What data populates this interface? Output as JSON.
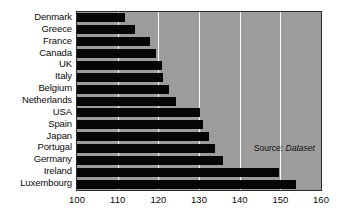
{
  "chart_data": {
    "type": "bar",
    "orientation": "horizontal",
    "title": "",
    "subtitle": "",
    "xlabel": "",
    "ylabel": "",
    "xlim": [
      100,
      160
    ],
    "ylim": null,
    "grid": true,
    "gridlines_x": [
      110,
      120,
      130,
      140,
      150
    ],
    "legend": null,
    "legend_position": "none",
    "xticks": [
      100,
      110,
      120,
      130,
      140,
      150,
      160
    ],
    "xtick_labels": [
      "100",
      "110",
      "120",
      "130",
      "140",
      "150",
      "160"
    ],
    "categories": [
      "Denmark",
      "Greece",
      "France",
      "Canada",
      "UK",
      "Italy",
      "Belgium",
      "Netherlands",
      "USA",
      "Spain",
      "Japan",
      "Portugal",
      "Germany",
      "Ireland",
      "Luxembourg"
    ],
    "values": [
      111.8,
      114.3,
      118.0,
      119.5,
      120.8,
      121.2,
      122.5,
      124.3,
      130.3,
      131.0,
      132.5,
      134.0,
      136.0,
      149.7,
      153.8
    ],
    "bar_color": "#060606",
    "plot_background": "#9d9d9d",
    "gridline_color": "#ffffff",
    "annotations": [
      {
        "name": "source-note",
        "prefix": "Source:",
        "value": "Dataset",
        "x": 143.5,
        "y_category": "Portugal"
      }
    ]
  },
  "axis": {
    "x_min_label": "100",
    "x_max_label": "160"
  }
}
